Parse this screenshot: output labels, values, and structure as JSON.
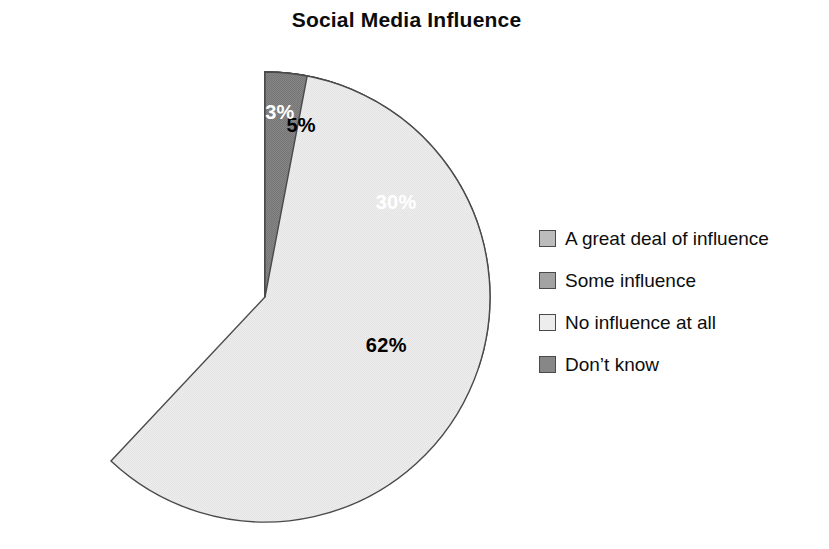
{
  "chart_data": {
    "type": "pie",
    "title": "Social Media Influence",
    "categories": [
      "A great deal of influence",
      "Some influence",
      "No influence at all",
      "Don’t know"
    ],
    "values": [
      5,
      30,
      62,
      3
    ],
    "value_labels": [
      "5%",
      "30%",
      "62%",
      "3%"
    ],
    "colors": [
      "#b9b9b9",
      "#9e9e9e",
      "#ebebeb",
      "#828282"
    ],
    "label_colors": [
      "#000000",
      "#ffffff",
      "#000000",
      "#ffffff"
    ],
    "slice_border_color": "#4a4a4a",
    "start_angle_deg": 0,
    "direction": "clockwise",
    "legend_position": "right",
    "grid": false,
    "xlabel": "",
    "ylabel": ""
  },
  "legend": {
    "items": [
      {
        "label": "A great deal of influence",
        "color": "#b9b9b9",
        "value_label": "5%"
      },
      {
        "label": "Some influence",
        "color": "#9e9e9e",
        "value_label": "30%"
      },
      {
        "label": "No influence at all",
        "color": "#ebebeb",
        "value_label": "62%"
      },
      {
        "label": "Don’t know",
        "color": "#828282",
        "value_label": "3%"
      }
    ]
  },
  "pie_geometry": {
    "cx": 265,
    "cy": 297,
    "r": 225
  }
}
